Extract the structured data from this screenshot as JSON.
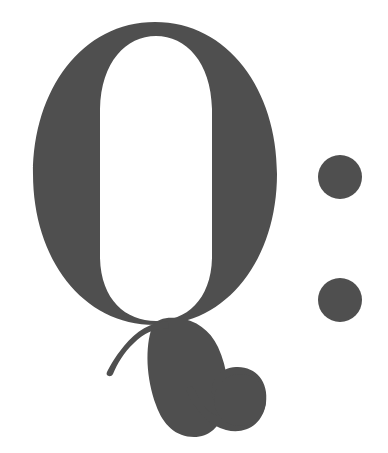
{
  "image": {
    "kind": "typographic-glyph-artwork",
    "rendered_text": "Q:",
    "description": "Large Didone serif capital letter Q with ornate swash tail and ball terminal, followed by a colon",
    "width": 388,
    "height": 453,
    "background_color": "#ffffff",
    "ink_color": "#4f4f4f"
  },
  "glyphs": {
    "letter": {
      "character": "Q",
      "name": "capital-q",
      "style": "didone-serif-high-contrast",
      "bounding_box": {
        "x": 33,
        "y": 22,
        "width": 244,
        "height": 415
      },
      "bowl": {
        "name": "q-bowl",
        "outer_box": {
          "x": 33,
          "y": 22,
          "width": 244,
          "height": 303
        },
        "counter_box": {
          "x": 100,
          "y": 36,
          "width": 112,
          "height": 284
        }
      },
      "tail": {
        "name": "q-swash-tail",
        "bounding_box": {
          "x": 106,
          "y": 320,
          "width": 160,
          "height": 117
        },
        "terminal": "ball-terminal",
        "ball_center": {
          "x": 240,
          "y": 400
        },
        "ball_radius": 26,
        "hairline_hook": true
      }
    },
    "punctuation": {
      "character": ":",
      "name": "colon",
      "dots": [
        {
          "name": "colon-dot-upper",
          "cx": 340,
          "cy": 177,
          "r": 22
        },
        {
          "name": "colon-dot-lower",
          "cx": 340,
          "cy": 300,
          "r": 22
        }
      ]
    }
  }
}
